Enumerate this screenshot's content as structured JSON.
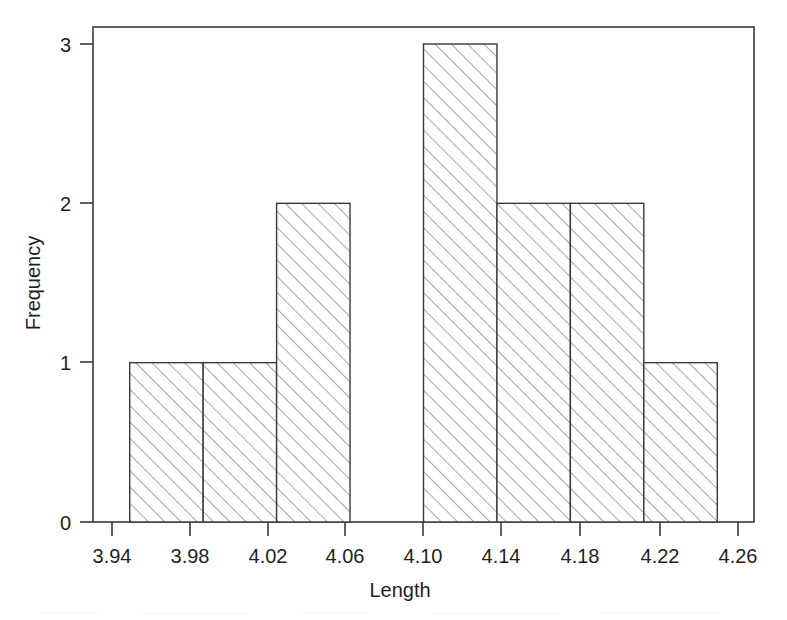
{
  "figure": {
    "background_color": "#ffffff",
    "line_color": "#3a3a3a",
    "hatch_color": "#7d7d7d",
    "text_color": "#1f1f1f"
  },
  "chart_data": {
    "type": "bar",
    "subtype": "histogram",
    "title": "",
    "subtitle": "",
    "xlabel": "Length",
    "ylabel": "Frequency",
    "xlim": [
      3.92,
      4.28
    ],
    "ylim": [
      0,
      3.1
    ],
    "grid": false,
    "legend": null,
    "bin_width": 0.04,
    "bin_edges": [
      3.94,
      3.98,
      4.02,
      4.06,
      4.1,
      4.14,
      4.18,
      4.22,
      4.26
    ],
    "categories": [
      "3.94-3.98",
      "3.98-4.02",
      "4.02-4.06",
      "4.06-4.10",
      "4.10-4.14",
      "4.14-4.18",
      "4.18-4.22",
      "4.22-4.26"
    ],
    "values": [
      1,
      1,
      2,
      0,
      3,
      2,
      2,
      1
    ],
    "total_count": 12,
    "bars": [
      {
        "left": 3.94,
        "right": 3.98,
        "frequency": 1
      },
      {
        "left": 3.98,
        "right": 4.02,
        "frequency": 1
      },
      {
        "left": 4.02,
        "right": 4.06,
        "frequency": 2
      },
      {
        "left": 4.06,
        "right": 4.1,
        "frequency": 0
      },
      {
        "left": 4.1,
        "right": 4.14,
        "frequency": 3
      },
      {
        "left": 4.14,
        "right": 4.18,
        "frequency": 2
      },
      {
        "left": 4.18,
        "right": 4.22,
        "frequency": 2
      },
      {
        "left": 4.22,
        "right": 4.26,
        "frequency": 1
      }
    ],
    "xticks": [
      3.94,
      3.98,
      4.02,
      4.06,
      4.1,
      4.14,
      4.18,
      4.22,
      4.26
    ],
    "xtick_labels": [
      "3.94",
      "3.98",
      "4.02",
      "4.06",
      "4.10",
      "4.14",
      "4.18",
      "4.22",
      "4.26"
    ],
    "yticks": [
      0,
      1,
      2,
      3
    ],
    "ytick_labels": [
      "0",
      "1",
      "2",
      "3"
    ],
    "bar_fill": "hatch-diagonal-45",
    "annotations": []
  },
  "axes": {
    "x_title": "Length",
    "y_title": "Frequency",
    "x_tick_labels": [
      "3.94",
      "3.98",
      "4.02",
      "4.06",
      "4.10",
      "4.14",
      "4.18",
      "4.22",
      "4.26"
    ],
    "y_tick_labels": [
      "0",
      "1",
      "2",
      "3"
    ]
  }
}
